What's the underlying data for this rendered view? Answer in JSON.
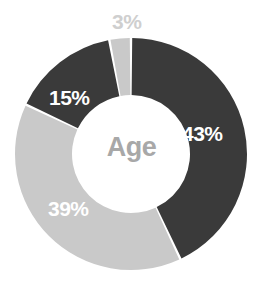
{
  "chart_data": {
    "type": "pie",
    "variant": "donut",
    "title": "Age",
    "center_label": "Age",
    "xlabel": "",
    "ylabel": "",
    "grid": false,
    "legend": "none",
    "units": "percent",
    "start_angle_deg": 0,
    "direction": "clockwise",
    "categories": [
      "43%",
      "39%",
      "15%",
      "3%"
    ],
    "values": [
      43,
      39,
      15,
      3
    ],
    "labels": [
      "43%",
      "39%",
      "15%",
      "3%"
    ],
    "colors": [
      "#3a3a3a",
      "#c9c9c9",
      "#3a3a3a",
      "#c9c9c9"
    ],
    "slices": [
      {
        "label": "43%",
        "value": 43,
        "color": "#3a3a3a",
        "label_color": "#ffffff",
        "label_position": "inside"
      },
      {
        "label": "39%",
        "value": 39,
        "color": "#c9c9c9",
        "label_color": "#ffffff",
        "label_position": "inside"
      },
      {
        "label": "15%",
        "value": 15,
        "color": "#3a3a3a",
        "label_color": "#ffffff",
        "label_position": "inside"
      },
      {
        "label": "3%",
        "value": 3,
        "color": "#c9c9c9",
        "label_color": "#cfcfcf",
        "label_position": "outside-top"
      }
    ]
  },
  "geometry": {
    "center_x": 131,
    "center_y": 154,
    "outer_radius": 116,
    "inner_radius": 59,
    "gap_degrees": 1.2
  },
  "palette": {
    "background": "#ffffff",
    "dark_slice": "#3a3a3a",
    "light_slice": "#c9c9c9",
    "center_text": "#a8a8a8",
    "outside_label": "#cfcfcf",
    "inside_label": "#ffffff"
  }
}
